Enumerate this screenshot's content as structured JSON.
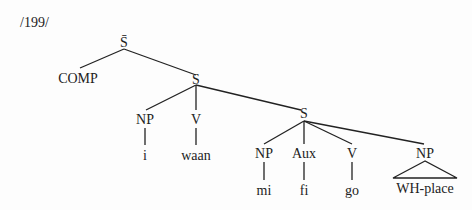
{
  "example_number": "/199/",
  "tree": {
    "root": {
      "label": "S̄"
    },
    "comp": {
      "label": "COMP"
    },
    "s1": {
      "label": "S"
    },
    "s1_np": {
      "label": "NP",
      "word": "i"
    },
    "s1_v": {
      "label": "V",
      "word": "waan"
    },
    "s2": {
      "label": "S"
    },
    "s2_np": {
      "label": "NP",
      "word": "mi"
    },
    "s2_aux": {
      "label": "Aux",
      "word": "fi"
    },
    "s2_v": {
      "label": "V",
      "word": "go"
    },
    "s2_np2": {
      "label": "NP",
      "word": "WH-place"
    }
  }
}
